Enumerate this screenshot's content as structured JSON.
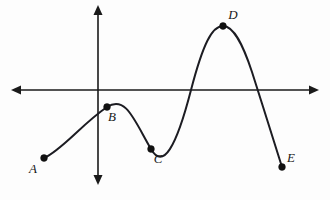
{
  "figure": {
    "background_color": "#fdfdfd",
    "curve_color": "#1c1c22",
    "axis_color": "#1a1a1a",
    "point_color": "#111111"
  },
  "axes": {
    "x_axis": {
      "name": "horizontal-axis",
      "y_pixel": 90,
      "x_start": 11,
      "x_end": 319,
      "arrows": "both"
    },
    "y_axis": {
      "name": "vertical-axis",
      "x_pixel": 98,
      "y_start": 5,
      "y_end": 185,
      "arrows": "both"
    }
  },
  "chart_data": {
    "type": "line",
    "title": "",
    "xlabel": "",
    "ylabel": "",
    "grid": false,
    "legend": "none",
    "axis_style": "double-arrow cartesian axes through origin",
    "origin_pixel": [
      98,
      90
    ],
    "labeled_points": [
      {
        "label": "A",
        "role": "left endpoint",
        "px": 44,
        "py": 158,
        "label_px": 33,
        "label_py": 170
      },
      {
        "label": "B",
        "role": "local maximum",
        "px": 107,
        "py": 107,
        "label_px": 112,
        "label_py": 118
      },
      {
        "label": "C",
        "role": "local minimum",
        "px": 151,
        "py": 149,
        "label_px": 158,
        "label_py": 160
      },
      {
        "label": "D",
        "role": "local maximum",
        "px": 223,
        "py": 26,
        "label_px": 233,
        "label_py": 16
      },
      {
        "label": "E",
        "role": "right endpoint",
        "px": 282,
        "py": 167,
        "label_px": 291,
        "label_py": 159
      }
    ],
    "x_intercepts_pixel": [
      191,
      258
    ],
    "curve_path": "M 44 158 C 62 150, 82 124, 107 107 C 126 95, 134 120, 151 149 C 163 170, 176 148, 191 90 C 203 44, 212 26, 223 26 C 234 26, 243 45, 252 72 C 262 103, 274 142, 282 167"
  }
}
